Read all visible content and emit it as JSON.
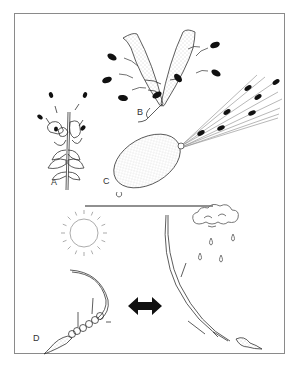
{
  "figure": {
    "panels": [
      {
        "id": "A",
        "label": "A",
        "subject": "flower head releasing seeds"
      },
      {
        "id": "B",
        "label": "B",
        "subject": "dehiscent pod ejecting seeds"
      },
      {
        "id": "C",
        "label": "C",
        "subject": "squirting fruit ejecting seeds"
      },
      {
        "id": "D",
        "label": "D",
        "subject": "hygroscopic awn coiling in dry / straightening in wet"
      }
    ],
    "icons": {
      "sun": "sun-icon",
      "rain_cloud": "rain-cloud-icon",
      "arrow": "double-arrow-icon"
    },
    "colors": {
      "line": "#333333",
      "seed": "#111111",
      "frame": "#8a8a8a",
      "stipple": "#999999"
    }
  }
}
